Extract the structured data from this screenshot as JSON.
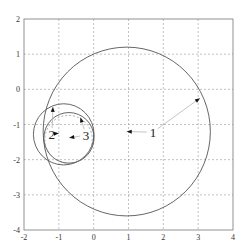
{
  "chart_data": {
    "type": "scatter",
    "title": "",
    "xlabel": "",
    "ylabel": "",
    "xlim": [
      -2,
      4
    ],
    "ylim": [
      -4,
      2
    ],
    "grid": true,
    "x_ticks": [
      "-2",
      "-1",
      "0",
      "1",
      "2",
      "3",
      "4"
    ],
    "y_ticks": [
      "2",
      "1",
      "0",
      "-1",
      "-2",
      "-3",
      "-4"
    ],
    "shapes": [
      {
        "name": "circle-large",
        "kind": "circle",
        "center": [
          0.95,
          -1.2
        ],
        "radius": 2.4,
        "style": "solid"
      },
      {
        "name": "circle-small-outer",
        "kind": "circle",
        "center": [
          -0.86,
          -1.28
        ],
        "radius": 0.87,
        "style": "solid"
      },
      {
        "name": "circle-small-inner",
        "kind": "circle",
        "center": [
          -0.71,
          -1.38
        ],
        "radius": 0.72,
        "style": "solid"
      },
      {
        "name": "circle-dashed",
        "kind": "circle",
        "center": [
          -0.72,
          -1.42
        ],
        "radius": 0.68,
        "style": "dashed"
      }
    ],
    "annotations": [
      {
        "label": "1",
        "text_pos": [
          1.7,
          -1.22
        ],
        "arrow_to": [
          0.95,
          -1.2
        ]
      },
      {
        "label": "1",
        "text_pos": [
          1.7,
          -1.22
        ],
        "arrow_to": [
          3.05,
          -0.25
        ]
      },
      {
        "label": "2",
        "text_pos": [
          -1.2,
          -1.27
        ],
        "arrow_to": [
          -1.17,
          -0.5
        ]
      },
      {
        "label": "2",
        "text_pos": [
          -1.2,
          -1.27
        ],
        "arrow_to": [
          -1.0,
          -1.25
        ]
      },
      {
        "label": "3",
        "text_pos": [
          -0.22,
          -1.3
        ],
        "arrow_to": [
          -0.7,
          -1.38
        ]
      },
      {
        "label": "3",
        "text_pos": [
          -0.22,
          -1.3
        ],
        "arrow_to": [
          -0.38,
          -0.8
        ]
      }
    ]
  }
}
